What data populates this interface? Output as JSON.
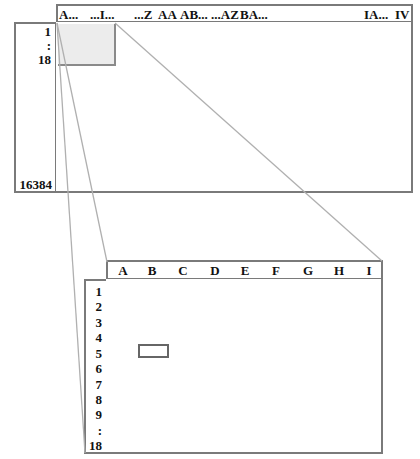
{
  "big_sheet": {
    "column_labels": [
      "A...",
      "...I...",
      "...Z",
      "AA",
      "AB...",
      "...AZ",
      "BA...",
      "IA...",
      "IV"
    ],
    "row_labels_top": [
      "1",
      ":",
      "18"
    ],
    "row_label_bottom": "16384",
    "highlight_region": "A1:I18"
  },
  "zoomed_sheet": {
    "column_labels": [
      "A",
      "B",
      "C",
      "D",
      "E",
      "F",
      "G",
      "H",
      "I"
    ],
    "row_labels": [
      "1",
      "2",
      "3",
      "4",
      "5",
      "6",
      "7",
      "8",
      "9",
      ":",
      "18"
    ],
    "selected_cell": "B5"
  },
  "colors": {
    "border": "#7a7a7a",
    "highlight_fill": "#ececec",
    "connector_line": "#b0b0b0",
    "selected_cell_border": "#666666"
  }
}
